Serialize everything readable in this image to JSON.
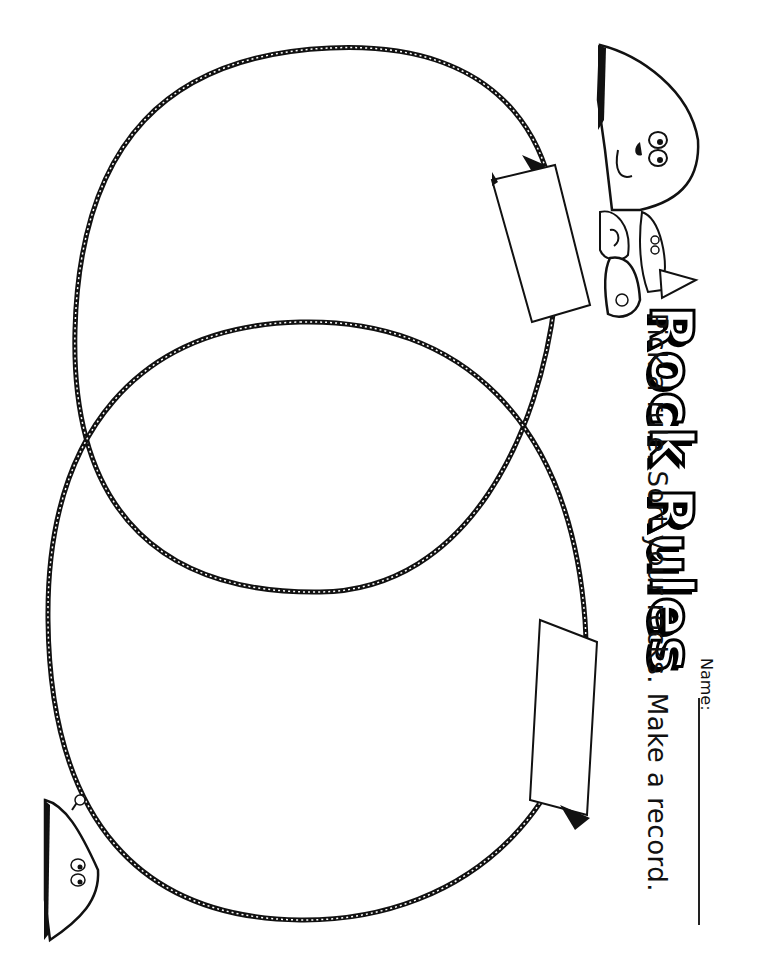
{
  "worksheet": {
    "title": "Rock Rules",
    "instructions": "Pick a rule. Sort your rocks. Make a record.",
    "name_label": "Name:",
    "name_value": ""
  },
  "venn": {
    "circles": [
      {
        "label": "",
        "position": "upper"
      },
      {
        "label": "",
        "position": "lower"
      }
    ],
    "label_cards": [
      {
        "text": "",
        "for": "upper"
      },
      {
        "text": "",
        "for": "lower"
      }
    ]
  },
  "illustrations": [
    "large-rock-character",
    "small-rock-characters-group",
    "rock-character-with-flower"
  ],
  "colors": {
    "ink": "#000000",
    "paper": "#ffffff"
  }
}
